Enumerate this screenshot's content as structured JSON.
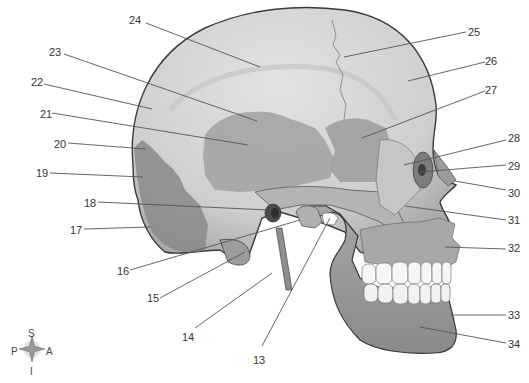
{
  "figure": {
    "labels": [
      {
        "n": "13",
        "tx": 253,
        "ty": 354,
        "x1": 262,
        "y1": 346,
        "x2": 330,
        "y2": 218
      },
      {
        "n": "14",
        "tx": 182,
        "ty": 331,
        "x1": 195,
        "y1": 328,
        "x2": 272,
        "y2": 273
      },
      {
        "n": "15",
        "tx": 147,
        "ty": 292,
        "x1": 160,
        "y1": 298,
        "x2": 245,
        "y2": 252
      },
      {
        "n": "16",
        "tx": 117,
        "ty": 265,
        "x1": 130,
        "y1": 270,
        "x2": 300,
        "y2": 220
      },
      {
        "n": "17",
        "tx": 70,
        "ty": 224,
        "x1": 84,
        "y1": 229,
        "x2": 150,
        "y2": 227
      },
      {
        "n": "18",
        "tx": 84,
        "ty": 197,
        "x1": 98,
        "y1": 202,
        "x2": 268,
        "y2": 210
      },
      {
        "n": "19",
        "tx": 36,
        "ty": 167,
        "x1": 50,
        "y1": 173,
        "x2": 143,
        "y2": 177
      },
      {
        "n": "20",
        "tx": 54,
        "ty": 138,
        "x1": 68,
        "y1": 143,
        "x2": 146,
        "y2": 149
      },
      {
        "n": "21",
        "tx": 40,
        "ty": 108,
        "x1": 52,
        "y1": 113,
        "x2": 248,
        "y2": 145
      },
      {
        "n": "22",
        "tx": 31,
        "ty": 76,
        "x1": 44,
        "y1": 84,
        "x2": 152,
        "y2": 109
      },
      {
        "n": "23",
        "tx": 49,
        "ty": 46,
        "x1": 64,
        "y1": 54,
        "x2": 257,
        "y2": 121
      },
      {
        "n": "24",
        "tx": 129,
        "ty": 14,
        "x1": 146,
        "y1": 23,
        "x2": 260,
        "y2": 67
      },
      {
        "n": "25",
        "tx": 468,
        "ty": 26,
        "x1": 466,
        "y1": 32,
        "x2": 344,
        "y2": 57
      },
      {
        "n": "26",
        "tx": 485,
        "ty": 55,
        "x1": 485,
        "y1": 62,
        "x2": 408,
        "y2": 81
      },
      {
        "n": "27",
        "tx": 485,
        "ty": 84,
        "x1": 485,
        "y1": 91,
        "x2": 362,
        "y2": 138
      },
      {
        "n": "28",
        "tx": 508,
        "ty": 132,
        "x1": 506,
        "y1": 140,
        "x2": 404,
        "y2": 165
      },
      {
        "n": "29",
        "tx": 508,
        "ty": 160,
        "x1": 506,
        "y1": 165,
        "x2": 420,
        "y2": 172
      },
      {
        "n": "30",
        "tx": 508,
        "ty": 187,
        "x1": 506,
        "y1": 190,
        "x2": 455,
        "y2": 181
      },
      {
        "n": "31",
        "tx": 508,
        "ty": 214,
        "x1": 506,
        "y1": 220,
        "x2": 405,
        "y2": 206
      },
      {
        "n": "32",
        "tx": 508,
        "ty": 242,
        "x1": 506,
        "y1": 249,
        "x2": 445,
        "y2": 247
      },
      {
        "n": "33",
        "tx": 508,
        "ty": 309,
        "x1": 506,
        "y1": 315,
        "x2": 451,
        "y2": 315
      },
      {
        "n": "34",
        "tx": 508,
        "ty": 338,
        "x1": 506,
        "y1": 343,
        "x2": 420,
        "y2": 327
      }
    ]
  },
  "compass": {
    "superior": "S",
    "inferior": "I",
    "posterior": "P",
    "anterior": "A"
  },
  "colors": {
    "skull_light": "#d9d9d9",
    "skull_mid": "#b8b8b8",
    "skull_dark": "#8e8e8e",
    "occipital": "#8a8a8a",
    "outline": "#3a3a3a",
    "leader": "#555555",
    "teeth": "#f7f7f7"
  }
}
